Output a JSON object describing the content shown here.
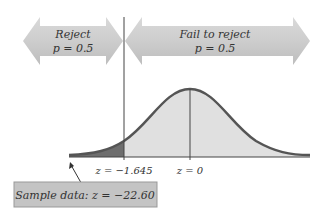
{
  "diagram": {
    "left_region": {
      "line1": "Reject",
      "line2": "p = 0.5"
    },
    "right_region": {
      "line1": "Fail to reject",
      "line2": "p = 0.5"
    },
    "critical_label": "z = −1.645",
    "center_label": "z = 0",
    "sample_label": "Sample data: z = −22.60"
  },
  "colors": {
    "arrow_fill": "#c8c8c8",
    "curve_fill": "#e0e0e0",
    "tail_fill": "#6e6e6e",
    "curve_stroke": "#555555",
    "sample_box_fill": "#c4c4c4",
    "line": "#444444"
  }
}
